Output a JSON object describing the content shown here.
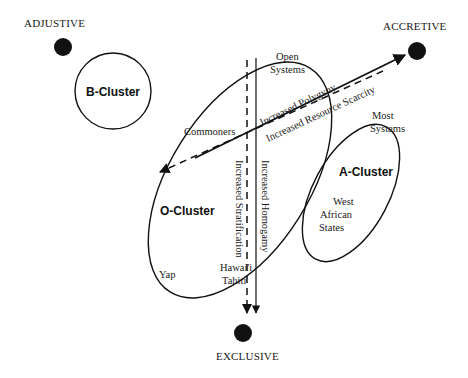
{
  "poles": {
    "adjustive": {
      "label": "ADJUSTIVE"
    },
    "accretive": {
      "label": "ACCRETIVE"
    },
    "exclusive": {
      "label": "EXCLUSIVE"
    }
  },
  "clusters": {
    "b": {
      "label": "B-Cluster"
    },
    "o": {
      "label": "O-Cluster"
    },
    "a": {
      "label": "A-Cluster"
    }
  },
  "labels": {
    "open_systems_1": "Open",
    "open_systems_2": "Systems",
    "most_systems_1": "Most",
    "most_systems_2": "Systems",
    "west_1": "West",
    "west_2": "African",
    "west_3": "States",
    "commoners": "Commoners",
    "yap": "Yap",
    "hawaii": "Hawai'i",
    "tahiti": "Tahiti"
  },
  "arrows": {
    "polygyny": "Increased Polygyny",
    "scarcity": "Increased Resource Scarcity",
    "stratification": "Increased Stratification",
    "homogamy": "Increased Homogamy"
  },
  "colors": {
    "ink": "#111111",
    "background": "#ffffff"
  }
}
